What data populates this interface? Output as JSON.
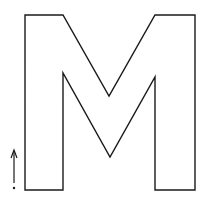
{
  "figure": {
    "letter": "M",
    "stroke_color": "#1a1a1a",
    "background_color": "#ffffff",
    "outline_points": "25,15 63,15 109,96 155,15 195,15 195,190 155,190 155,77 110,157 63,73 63,190 25,190",
    "arrow": {
      "x": 14,
      "y_start": 183,
      "y_end": 150,
      "dot_y": 188
    }
  }
}
